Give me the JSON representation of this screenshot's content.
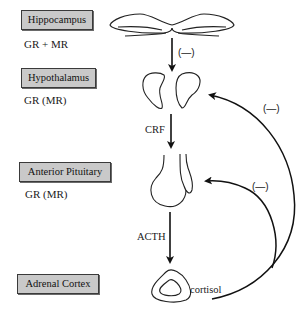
{
  "diagram": {
    "type": "hpa-axis-negative-feedback",
    "organs": [
      {
        "name": "Hippocampus",
        "receptors": "GR + MR"
      },
      {
        "name": "Hypothalamus",
        "receptors": "GR (MR)"
      },
      {
        "name": "Anterior Pituitary",
        "receptors": "GR (MR)"
      },
      {
        "name": "Adrenal Cortex",
        "receptors": ""
      }
    ],
    "signals": {
      "hippocampus_to_hypothalamus": "(—)",
      "hypothalamus_to_pituitary": "CRF",
      "pituitary_to_adrenal": "ACTH",
      "adrenal_output": "cortisol"
    },
    "feedback": {
      "to_hypothalamus": "(—)",
      "to_pituitary": "(—)"
    },
    "colors": {
      "box_fill": "#c9c9c9",
      "box_border": "#3a3a3a",
      "line": "#111111"
    }
  }
}
